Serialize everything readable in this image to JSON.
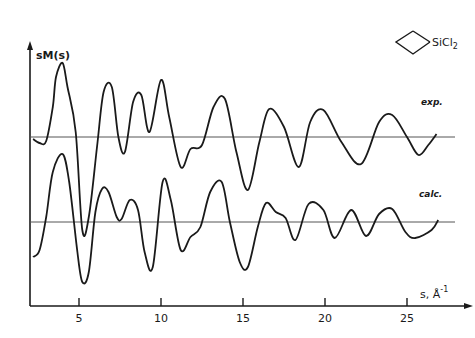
{
  "chart_data": {
    "type": "line",
    "title": "",
    "molecule_label": "SiCl2",
    "molecule_label_main": "SiCl",
    "molecule_label_sub": "2",
    "ylabel": "sM(s)",
    "xlabel_main": "s, Å",
    "xlabel_sup": "-1",
    "xticks": [
      5,
      10,
      15,
      20,
      25
    ],
    "xlim": [
      2,
      28
    ],
    "grid": false,
    "legend": "inline curve labels",
    "series": [
      {
        "name": "exp.",
        "baseline_y_px": 137,
        "x": [
          2.2,
          2.6,
          3.0,
          3.4,
          3.6,
          4.0,
          4.3,
          4.8,
          5.2,
          5.6,
          6.1,
          6.5,
          7.0,
          7.4,
          7.8,
          8.3,
          8.8,
          9.3,
          10.0,
          10.5,
          11.2,
          11.8,
          12.5,
          13.2,
          13.9,
          14.6,
          15.3,
          16.0,
          16.6,
          17.5,
          18.4,
          19.1,
          19.9,
          21.0,
          22.2,
          23.3,
          24.1,
          25.0,
          25.7,
          26.3,
          26.8
        ],
        "y": [
          -2,
          -6,
          -4,
          30,
          60,
          74,
          50,
          5,
          -93,
          -80,
          -10,
          45,
          50,
          0,
          -15,
          35,
          42,
          5,
          57,
          20,
          -30,
          -12,
          -8,
          30,
          38,
          -15,
          -53,
          -5,
          28,
          10,
          -30,
          15,
          27,
          -5,
          -27,
          15,
          22,
          0,
          -18,
          -8,
          3
        ]
      },
      {
        "name": "calc.",
        "baseline_y_px": 222,
        "x": [
          2.2,
          2.6,
          3.0,
          3.4,
          4.0,
          4.4,
          4.9,
          5.2,
          5.6,
          6.0,
          6.4,
          6.8,
          7.3,
          7.6,
          8.1,
          8.6,
          9.0,
          9.5,
          10.1,
          10.6,
          11.2,
          11.8,
          12.4,
          13.0,
          13.7,
          14.2,
          14.8,
          15.3,
          15.9,
          16.4,
          17.0,
          17.6,
          18.2,
          19.0,
          19.9,
          20.6,
          21.6,
          22.5,
          23.3,
          24.1,
          24.9,
          25.5,
          26.5,
          26.9
        ],
        "y": [
          -35,
          -28,
          5,
          50,
          68,
          40,
          -30,
          -60,
          -50,
          10,
          33,
          30,
          5,
          3,
          22,
          12,
          -30,
          -45,
          40,
          22,
          -28,
          -15,
          -5,
          30,
          40,
          0,
          -40,
          -45,
          -5,
          19,
          10,
          4,
          -18,
          18,
          12,
          -16,
          12,
          -14,
          8,
          13,
          -10,
          -16,
          -8,
          2
        ]
      }
    ]
  },
  "labels": {
    "exp": "exp.",
    "calc": "calc."
  }
}
